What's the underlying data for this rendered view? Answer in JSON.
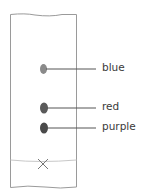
{
  "diagram": {
    "type": "paper-chromatography",
    "spots": [
      {
        "label": "blue",
        "color": "#8a8a8a"
      },
      {
        "label": "red",
        "color": "#5a5a5a"
      },
      {
        "label": "purple",
        "color": "#4a4a4a"
      }
    ],
    "baseline_marker": "×",
    "colors": {
      "paper_outline": "#9a9a9a",
      "baseline": "#c8c8c8",
      "leader_line": "#555555",
      "text": "#3a3a3a"
    }
  }
}
